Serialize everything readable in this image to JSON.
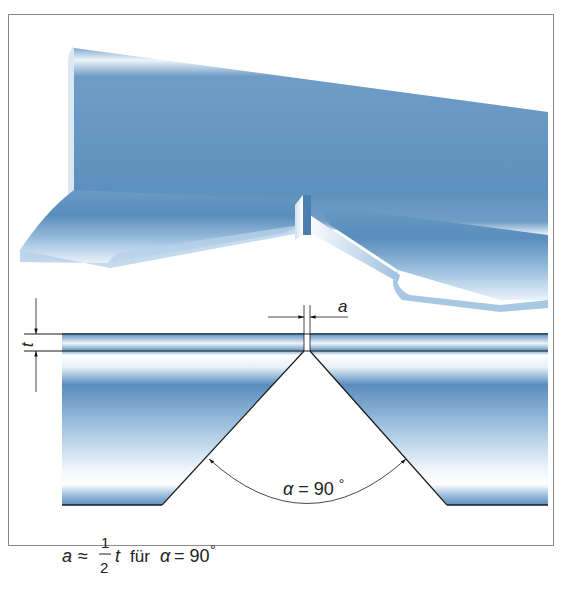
{
  "figure": {
    "colors": {
      "steel_dark": "#5b8fbd",
      "steel_mid": "#8db5d8",
      "steel_light": "#e8f1f9",
      "line": "#1a1a1a",
      "frame": "#8a8a8a"
    },
    "top_view": {
      "description": "3D view of a T-joint / angle profile with a notch gap"
    },
    "cross_section": {
      "dim_a_label": "a",
      "dim_t_label": "t",
      "angle_label": "α = 90°",
      "angle_symbol": "α",
      "angle_eq": "= 90",
      "angle_unit": "°"
    },
    "formula": {
      "lhs": "a",
      "approx": "≈",
      "frac_num": "1",
      "frac_den": "2",
      "var": "t",
      "text_fuer": "für",
      "alpha": "α",
      "eq": "= 90",
      "deg": "°"
    }
  }
}
